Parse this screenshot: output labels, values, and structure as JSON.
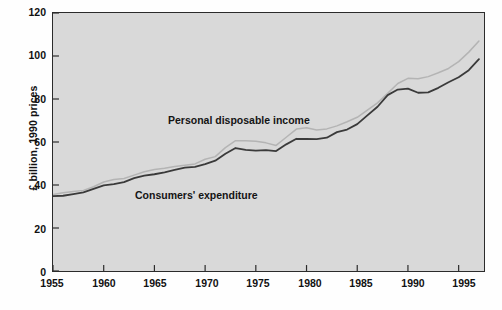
{
  "chart_data": {
    "type": "line",
    "title": "",
    "xlabel": "",
    "ylabel": "£ billion, 1990 prices",
    "xlim": [
      1955,
      1997.5
    ],
    "ylim": [
      0,
      120
    ],
    "grid": false,
    "legend_position": "inline-annotations",
    "xticks": [
      "1955",
      "1960",
      "1965",
      "1970",
      "1975",
      "1980",
      "1985",
      "1990",
      "1995"
    ],
    "yticks": [
      "0",
      "20",
      "40",
      "60",
      "80",
      "100",
      "120"
    ],
    "annotations": [
      {
        "text": "Personal disposable income",
        "series": "Personal disposable income"
      },
      {
        "text": "Consumers' expenditure",
        "series": "Consumers' expenditure"
      }
    ],
    "x": [
      1955,
      1956,
      1957,
      1958,
      1959,
      1960,
      1961,
      1962,
      1963,
      1964,
      1965,
      1966,
      1967,
      1968,
      1969,
      1970,
      1971,
      1972,
      1973,
      1974,
      1975,
      1976,
      1977,
      1978,
      1979,
      1980,
      1981,
      1982,
      1983,
      1984,
      1985,
      1986,
      1987,
      1988,
      1989,
      1990,
      1991,
      1992,
      1993,
      1994,
      1995,
      1996,
      1997
    ],
    "series": [
      {
        "name": "Consumers' expenditure",
        "color": "#3a3a3a",
        "values": [
          34.8,
          35.0,
          35.8,
          36.6,
          38.2,
          39.8,
          40.4,
          41.3,
          43.2,
          44.4,
          45.0,
          45.9,
          47.0,
          48.1,
          48.4,
          49.7,
          51.3,
          54.5,
          57.2,
          56.3,
          56.0,
          56.2,
          55.8,
          58.9,
          61.5,
          61.4,
          61.3,
          62.0,
          64.6,
          65.8,
          68.3,
          72.4,
          76.4,
          81.8,
          84.4,
          84.8,
          82.9,
          83.1,
          85.2,
          87.8,
          90.1,
          93.4,
          98.5
        ]
      },
      {
        "name": "Personal disposable income",
        "color": "#b4b4b4",
        "values": [
          35.6,
          36.4,
          37.0,
          37.5,
          39.2,
          41.4,
          42.6,
          43.0,
          44.6,
          46.2,
          47.2,
          47.8,
          48.6,
          49.2,
          49.8,
          52.0,
          53.2,
          57.4,
          60.6,
          60.6,
          60.4,
          59.6,
          58.4,
          62.2,
          66.0,
          66.6,
          65.6,
          66.1,
          67.5,
          69.4,
          71.5,
          74.8,
          78.2,
          82.6,
          87.2,
          89.6,
          89.4,
          90.4,
          92.2,
          94.2,
          97.4,
          101.8,
          107.0
        ]
      }
    ]
  }
}
